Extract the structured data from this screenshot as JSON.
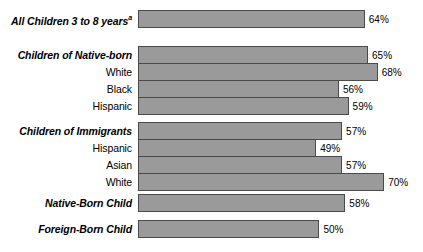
{
  "chart_data": {
    "type": "bar",
    "orientation": "horizontal",
    "title": "",
    "xlabel": "",
    "ylabel": "",
    "grid": false,
    "legend": "none",
    "xlim": [
      0,
      75
    ],
    "value_suffix": "%",
    "categories": [
      "All Children 3 to 8 years",
      "Children of Native-born",
      "White",
      "Black",
      "Hispanic",
      "Children of Immigrants",
      "Hispanic",
      "Asian",
      "White",
      "Native-Born Child",
      "Foreign-Born Child"
    ],
    "values": [
      64,
      65,
      68,
      56,
      59,
      57,
      49,
      57,
      70,
      58,
      50
    ],
    "value_labels": [
      "64%",
      "65%",
      "68%",
      "56%",
      "59%",
      "57%",
      "49%",
      "57%",
      "70%",
      "58%",
      "50%"
    ],
    "footnote_marker": "a"
  },
  "rows": [
    {
      "label": "All Children 3 to 8 years",
      "style": "group",
      "footnote": "a",
      "value": 64,
      "value_label": "64%",
      "top": 10
    },
    {
      "label": "Children of Native-born",
      "style": "group",
      "footnote": "",
      "value": 65,
      "value_label": "65%",
      "top": 46
    },
    {
      "label": "White",
      "style": "sub",
      "footnote": "",
      "value": 68,
      "value_label": "68%",
      "top": 63
    },
    {
      "label": "Black",
      "style": "sub",
      "footnote": "",
      "value": 56,
      "value_label": "56%",
      "top": 80
    },
    {
      "label": "Hispanic",
      "style": "sub",
      "footnote": "",
      "value": 59,
      "value_label": "59%",
      "top": 97
    },
    {
      "label": "Children of Immigrants",
      "style": "group",
      "footnote": "",
      "value": 57,
      "value_label": "57%",
      "top": 122
    },
    {
      "label": "Hispanic",
      "style": "sub",
      "footnote": "",
      "value": 49,
      "value_label": "49%",
      "top": 139
    },
    {
      "label": "Asian",
      "style": "sub",
      "footnote": "",
      "value": 57,
      "value_label": "57%",
      "top": 156
    },
    {
      "label": "White",
      "style": "sub",
      "footnote": "",
      "value": 70,
      "value_label": "70%",
      "top": 173
    },
    {
      "label": "Native-Born Child",
      "style": "group",
      "footnote": "",
      "value": 58,
      "value_label": "58%",
      "top": 194
    },
    {
      "label": "Foreign-Born Child",
      "style": "group",
      "footnote": "",
      "value": 50,
      "value_label": "50%",
      "top": 220
    }
  ],
  "geometry": {
    "bar_origin_pct": -6.0,
    "px_per_pct": 3.24,
    "label_column_width": 138
  },
  "colors": {
    "bar_fill": "#9a9a9a",
    "bar_border": "#4a4a4a",
    "text": "#000000",
    "background": "#ffffff"
  }
}
